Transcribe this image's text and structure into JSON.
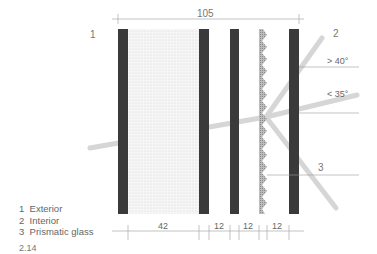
{
  "diagram": {
    "overall_dimension": "105",
    "side_labels": {
      "exterior_marker": "1",
      "interior_marker": "2",
      "prism_marker": "3"
    },
    "angles": {
      "upper": "> 40°",
      "lower": "< 35°"
    },
    "segment_dimensions": [
      "42",
      "12",
      "12",
      "12"
    ],
    "legend": [
      {
        "num": "1",
        "text": "Exterior"
      },
      {
        "num": "2",
        "text": "Interior"
      },
      {
        "num": "3",
        "text": "Prismatic glass"
      }
    ],
    "figure_number": "2.14",
    "colors": {
      "pane": "#3a3a3a",
      "beam": "#d4d4d4",
      "dim_line": "#999999",
      "fill": "#f1f1f1"
    }
  }
}
